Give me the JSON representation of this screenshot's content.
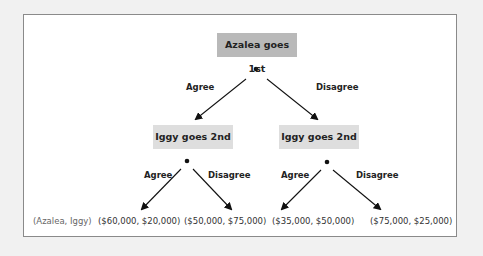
{
  "diagram": {
    "type": "game-tree",
    "colors": {
      "root_box": "#b9b9b9",
      "child_box": "#dedede",
      "frame_border": "#8a8a8a",
      "background": "#f1f1f1"
    },
    "root": {
      "label": "Azalea goes 1st",
      "branches": [
        "Agree",
        "Disagree"
      ]
    },
    "second_level": [
      {
        "label": "Iggy goes 2nd",
        "via": "Agree",
        "branches": [
          "Agree",
          "Disagree"
        ]
      },
      {
        "label": "Iggy goes 2nd",
        "via": "Disagree",
        "branches": [
          "Agree",
          "Disagree"
        ]
      }
    ],
    "payoff_legend": "(Azalea, Iggy)",
    "payoffs": [
      "($60,000, $20,000)",
      "($50,000, $75,000)",
      "($35,000, $50,000)",
      "($75,000, $25,000)"
    ]
  }
}
